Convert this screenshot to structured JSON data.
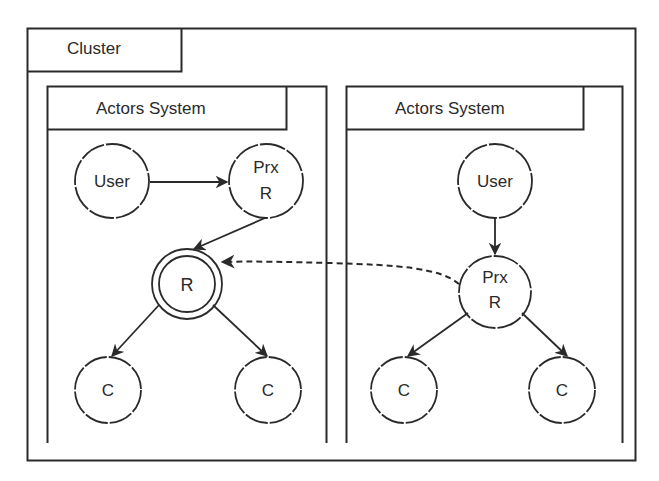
{
  "cluster": {
    "label": "Cluster"
  },
  "actor_systems": [
    {
      "label": "Actors System",
      "nodes": {
        "user": "User",
        "proxy_line1": "Prx",
        "proxy_line2": "R",
        "router": "R",
        "child_left": "C",
        "child_right": "C"
      }
    },
    {
      "label": "Actors System",
      "nodes": {
        "user": "User",
        "proxy_line1": "Prx",
        "proxy_line2": "R",
        "child_left": "C",
        "child_right": "C"
      }
    }
  ],
  "edges": [
    {
      "from": "User (left)",
      "to": "Prx R (left)",
      "style": "solid"
    },
    {
      "from": "Prx R (left)",
      "to": "R (left)",
      "style": "solid"
    },
    {
      "from": "R (left)",
      "to": "C (left-1)",
      "style": "solid"
    },
    {
      "from": "R (left)",
      "to": "C (left-2)",
      "style": "solid"
    },
    {
      "from": "User (right)",
      "to": "Prx R (right)",
      "style": "solid"
    },
    {
      "from": "Prx R (right)",
      "to": "R (left)",
      "style": "dashed"
    },
    {
      "from": "Prx R (right)",
      "to": "C (right-1)",
      "style": "solid"
    },
    {
      "from": "Prx R (right)",
      "to": "C (right-2)",
      "style": "solid"
    }
  ],
  "colors": {
    "stroke": "#2a2a2a",
    "background": "#ffffff"
  }
}
